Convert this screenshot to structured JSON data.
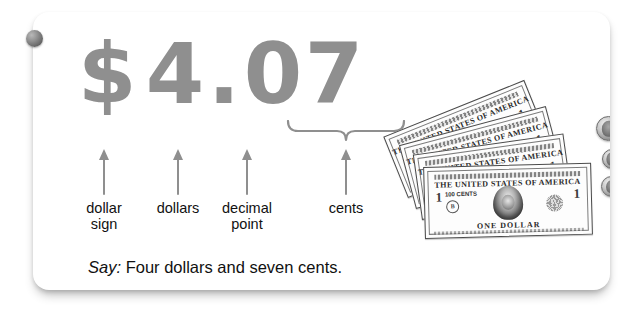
{
  "card": {
    "amount": {
      "dollar_sign": "$",
      "dollars_digit": "4",
      "decimal_point": ".",
      "cents_tens": "0",
      "cents_ones": "7",
      "full_text": "$4.07",
      "color": "#8f8f8f"
    },
    "labels": [
      {
        "id": "dollar-sign",
        "text": "dollar\nsign"
      },
      {
        "id": "dollars",
        "text": "dollars"
      },
      {
        "id": "decimal-point",
        "text": "decimal\npoint"
      },
      {
        "id": "cents",
        "text": "cents"
      }
    ],
    "say_line": {
      "prefix": "Say:",
      "sentence": "Four dollars and seven cents."
    },
    "money": {
      "bills": [
        {
          "denomination": "1",
          "country_line": "THE UNITED STATES OF AMERICA",
          "cents_note": "100 CENTS",
          "bottom_line": "ONE DOLLAR",
          "seal_letter": "B"
        },
        {
          "denomination": "1",
          "country_line": "THE UNITED STATES OF AMERICA",
          "cents_note": "100 CENTS",
          "bottom_line": "ONE DOLLAR",
          "seal_letter": "B"
        },
        {
          "denomination": "1",
          "country_line": "THE UNITED STATES OF AMERICA",
          "cents_note": "100 CENTS",
          "bottom_line": "ONE DOLLAR",
          "seal_letter": "B"
        },
        {
          "denomination": "1",
          "country_line": "THE UNITED STATES OF AMERICA",
          "cents_note": "100 CENTS",
          "bottom_line": "ONE DOLLAR",
          "seal_letter": "B"
        }
      ],
      "coins": [
        {
          "name": "nickel",
          "value": "5"
        },
        {
          "name": "penny",
          "value": "1"
        },
        {
          "name": "penny",
          "value": "1"
        }
      ]
    }
  }
}
